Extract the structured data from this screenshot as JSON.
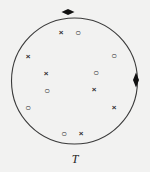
{
  "figure": {
    "kind": "point-set-diagram",
    "background_color": "#f2f2f1",
    "stroke_color": "#3a3a3a",
    "label": "T",
    "label_position": {
      "x": 75,
      "y": 159
    },
    "boundary": {
      "name": "circle-T",
      "cx": 74.5,
      "cy": 81,
      "r": 63,
      "stroke_width": 1.1
    },
    "boundary_markers": [
      {
        "id": "marker-top",
        "glyph": "diamond-horizontal",
        "x": 68,
        "y": 12,
        "w": 13,
        "h": 6,
        "color": "#111111"
      },
      {
        "id": "marker-right",
        "glyph": "diamond-vertical",
        "x": 136,
        "y": 80,
        "w": 6,
        "h": 15,
        "color": "#111111"
      }
    ],
    "points": [
      {
        "id": "p1",
        "type": "cross",
        "glyph": "×",
        "x": 61,
        "y": 32
      },
      {
        "id": "p2",
        "type": "circle",
        "glyph": "○",
        "x": 78,
        "y": 32
      },
      {
        "id": "p3",
        "type": "cross",
        "glyph": "×",
        "x": 28,
        "y": 56
      },
      {
        "id": "p4",
        "type": "circle",
        "glyph": "○",
        "x": 114,
        "y": 55
      },
      {
        "id": "p5",
        "type": "cross",
        "glyph": "×",
        "x": 46,
        "y": 73
      },
      {
        "id": "p6",
        "type": "circle",
        "glyph": "○",
        "x": 96,
        "y": 72
      },
      {
        "id": "p7",
        "type": "circle",
        "glyph": "○",
        "x": 47,
        "y": 90
      },
      {
        "id": "p8",
        "type": "cross",
        "glyph": "×",
        "x": 94,
        "y": 89
      },
      {
        "id": "p9",
        "type": "circle",
        "glyph": "○",
        "x": 28,
        "y": 107
      },
      {
        "id": "p10",
        "type": "cross",
        "glyph": "×",
        "x": 114,
        "y": 107
      },
      {
        "id": "p11",
        "type": "circle",
        "glyph": "○",
        "x": 64,
        "y": 133
      },
      {
        "id": "p12",
        "type": "cross",
        "glyph": "×",
        "x": 81,
        "y": 133
      }
    ]
  }
}
